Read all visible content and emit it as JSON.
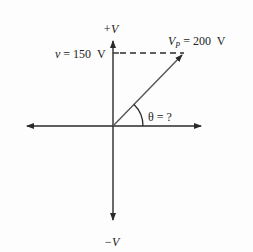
{
  "diagram": {
    "type": "phasor",
    "axes": {
      "positive_vertical_label": "+V",
      "negative_vertical_label": "−V"
    },
    "projection_label": {
      "var": "v",
      "equals": " = 150  V"
    },
    "vector_label": {
      "var": "V",
      "subscript": "P",
      "equals": " = 200  V"
    },
    "angle_label": "θ = ?",
    "values": {
      "instantaneous_voltage_V": 150,
      "peak_voltage_V": 200,
      "angle": "unknown"
    },
    "colors": {
      "line": "#2a2a2a",
      "background": "#fdfdfd"
    }
  }
}
